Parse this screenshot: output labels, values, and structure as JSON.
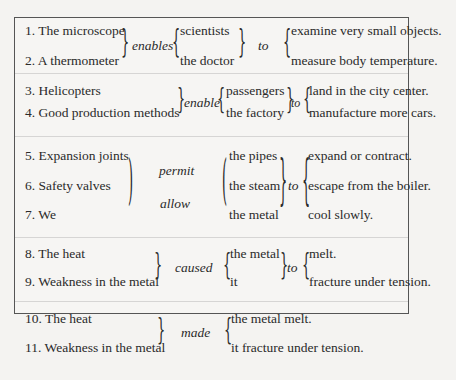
{
  "exercise": {
    "groups": [
      {
        "subjects": [
          "1. The microscope",
          "2. A thermometer"
        ],
        "verbs": [
          "enables"
        ],
        "objects": [
          "scientists",
          "the doctor"
        ],
        "connector": "to",
        "complements": [
          "examine very small objects.",
          "measure body temperature."
        ]
      },
      {
        "subjects": [
          "3. Helicopters",
          "4. Good production methods"
        ],
        "verbs": [
          "enable"
        ],
        "objects": [
          "passengers",
          "the factory"
        ],
        "connector": "to",
        "complements": [
          "land in the city center.",
          "manufacture more cars."
        ]
      },
      {
        "subjects": [
          "5. Expansion joints",
          "6. Safety valves",
          "7. We"
        ],
        "verbs": [
          "permit",
          "allow"
        ],
        "objects": [
          "the pipes",
          "the steam",
          "the metal"
        ],
        "connector": "to",
        "complements": [
          "expand or contract.",
          "escape from the boiler.",
          "cool slowly."
        ]
      },
      {
        "subjects": [
          "8. The heat",
          "9. Weakness in the metal"
        ],
        "verbs": [
          "caused"
        ],
        "objects": [
          "the metal",
          "it"
        ],
        "connector": "to",
        "complements": [
          "melt.",
          "fracture under tension."
        ]
      },
      {
        "subjects": [
          "10. The heat",
          "11. Weakness in the metal"
        ],
        "verbs": [
          "made"
        ],
        "objects": [
          "the metal melt.",
          "it fracture under tension."
        ]
      }
    ]
  }
}
